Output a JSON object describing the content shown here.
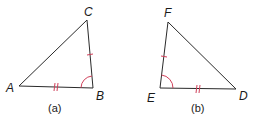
{
  "figures": [
    {
      "caption": "(a)",
      "vertices": [
        {
          "name": "A",
          "x": 19,
          "y": 86
        },
        {
          "name": "B",
          "x": 93,
          "y": 88
        },
        {
          "name": "C",
          "x": 87,
          "y": 20
        }
      ],
      "marks": {
        "single_tick_side": "BC",
        "double_tick_side": "AB",
        "angle": "B"
      }
    },
    {
      "caption": "(b)",
      "vertices": [
        {
          "name": "F",
          "x": 168,
          "y": 22
        },
        {
          "name": "E",
          "x": 160,
          "y": 88
        },
        {
          "name": "D",
          "x": 236,
          "y": 89
        }
      ],
      "marks": {
        "single_tick_side": "EF",
        "double_tick_side": "ED",
        "angle": "E"
      }
    }
  ],
  "colors": {
    "line": "#2a2a2a",
    "mark": "#d0405a"
  }
}
